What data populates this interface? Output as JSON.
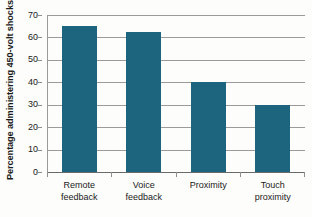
{
  "chart_data": {
    "type": "bar",
    "title": "",
    "subtitle": "",
    "xlabel": "",
    "ylabel": "Percentage administering 450-volt shocks",
    "categories": [
      "Remote feedback",
      "Voice feedback",
      "Proximity",
      "Touch proximity"
    ],
    "category_lines": [
      [
        "Remote",
        "feedback"
      ],
      [
        "Voice",
        "feedback"
      ],
      [
        "Proximity",
        ""
      ],
      [
        "Touch",
        "proximity"
      ]
    ],
    "values": [
      65,
      62.5,
      40,
      30
    ],
    "ylim": [
      0,
      70
    ],
    "ytick_labels": [
      "70",
      "60",
      "50",
      "40",
      "30",
      "20",
      "10",
      "0"
    ],
    "ytick_values": [
      70,
      60,
      50,
      40,
      30,
      20,
      10,
      0
    ],
    "grid": true,
    "legend": "none",
    "bar_color": "#1d647f",
    "gridline_color": "#9a9a9a",
    "axis_color": "#6a6a6a",
    "background_color": "#fdfdfb"
  }
}
